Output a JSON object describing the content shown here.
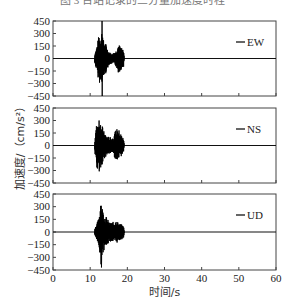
{
  "header_cut_text": "图 3  台站记录的三分量加速度时程",
  "chart_data": {
    "type": "line",
    "layout": "3 stacked panels sharing x-axis",
    "xlabel": "时间/s",
    "ylabel": "加速度/（cm/s²）",
    "xlim": [
      0,
      60
    ],
    "xticks": [
      0,
      10,
      20,
      30,
      40,
      50,
      60
    ],
    "ylim": [
      -450,
      450
    ],
    "yticks": [
      450,
      300,
      150,
      0,
      -150,
      -300,
      -450
    ],
    "grid": false,
    "legend_position": "upper right (per panel)",
    "series": [
      {
        "name": "EW",
        "onset_s": 11.2,
        "end_s": 19.2,
        "peak_positive": 450,
        "peak_negative": -450,
        "peak_time_s": 13.2,
        "envelope": [
          [
            11.2,
            60
          ],
          [
            11.8,
            150
          ],
          [
            12.4,
            300
          ],
          [
            13.0,
            260
          ],
          [
            13.2,
            450
          ],
          [
            13.6,
            220
          ],
          [
            14.2,
            180
          ],
          [
            15,
            80
          ],
          [
            16,
            60
          ],
          [
            17,
            100
          ],
          [
            17.6,
            180
          ],
          [
            18.2,
            140
          ],
          [
            19.0,
            100
          ],
          [
            19.2,
            0
          ]
        ]
      },
      {
        "name": "NS",
        "onset_s": 11.2,
        "end_s": 19.2,
        "peak_positive": 300,
        "peak_negative": -310,
        "peak_time_s": 12.4,
        "envelope": [
          [
            11.2,
            60
          ],
          [
            11.8,
            290
          ],
          [
            12.4,
            300
          ],
          [
            13.0,
            280
          ],
          [
            13.6,
            180
          ],
          [
            14.4,
            120
          ],
          [
            15.2,
            100
          ],
          [
            16.2,
            100
          ],
          [
            17.0,
            200
          ],
          [
            17.6,
            200
          ],
          [
            18.2,
            150
          ],
          [
            19.0,
            80
          ],
          [
            19.2,
            0
          ]
        ]
      },
      {
        "name": "UD",
        "onset_s": 11.2,
        "end_s": 19.2,
        "peak_positive": 310,
        "peak_negative": -420,
        "peak_time_s": 13.0,
        "envelope": [
          [
            11.2,
            50
          ],
          [
            11.8,
            100
          ],
          [
            12.4,
            180
          ],
          [
            12.8,
            420
          ],
          [
            13.2,
            310
          ],
          [
            13.8,
            200
          ],
          [
            14.4,
            180
          ],
          [
            15.2,
            110
          ],
          [
            16.2,
            120
          ],
          [
            17.0,
            140
          ],
          [
            17.6,
            110
          ],
          [
            18.4,
            90
          ],
          [
            19.0,
            70
          ],
          [
            19.2,
            0
          ]
        ]
      }
    ]
  },
  "panels": [
    {
      "legend": "EW"
    },
    {
      "legend": "NS"
    },
    {
      "legend": "UD"
    }
  ],
  "axis": {
    "yticks": [
      "450",
      "300",
      "150",
      "0",
      "−150",
      "−300",
      "−450"
    ],
    "xticks": [
      "0",
      "10",
      "20",
      "30",
      "40",
      "50",
      "60"
    ],
    "xlabel": "时间/s",
    "ylabel": "加速度/（cm/s²）"
  }
}
